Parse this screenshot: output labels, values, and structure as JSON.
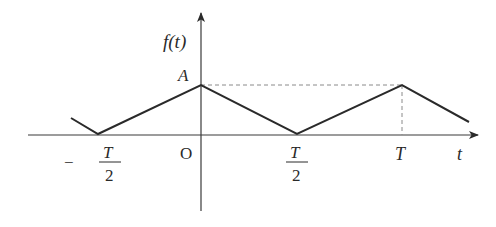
{
  "diagram": {
    "type": "periodic-triangle-wave",
    "labels": {
      "y_axis": "f(t)",
      "x_axis": "t",
      "amplitude": "A",
      "origin": "O",
      "period": "T",
      "half_period_num": "T",
      "half_period_den": "2",
      "neg_half_period_sign": "−",
      "neg_half_period_num": "T",
      "neg_half_period_den": "2"
    },
    "colors": {
      "line": "#2a2a2a",
      "axis": "#3a3a3a",
      "dashed": "#8a8a8a"
    },
    "waveform_points": [
      {
        "t": "-3T/4 (partial)",
        "f": "A/2 approx"
      },
      {
        "t": "-T/2",
        "f": 0
      },
      {
        "t": "0",
        "f": "A"
      },
      {
        "t": "T/2",
        "f": 0
      },
      {
        "t": "T",
        "f": "A"
      },
      {
        "t": "~1.33T (partial)",
        "f": "~A/3"
      }
    ]
  }
}
